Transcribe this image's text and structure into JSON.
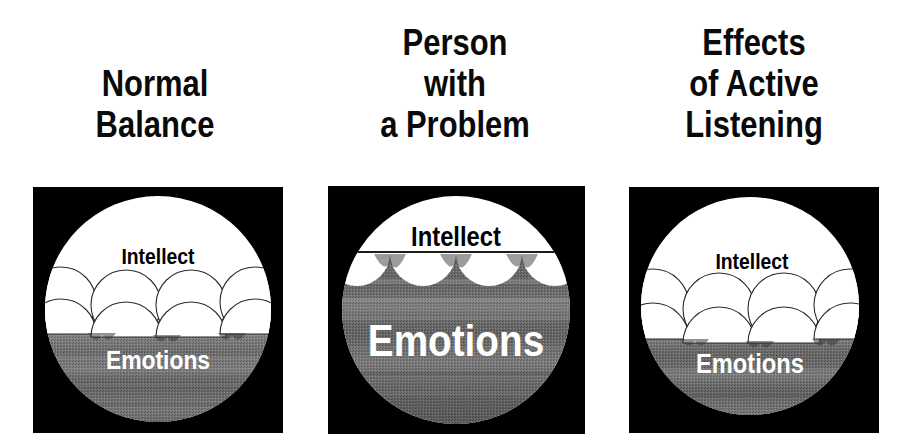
{
  "figure": {
    "background_color": "#ffffff",
    "panel_background_color": "#000000",
    "intellect_color": "#ffffff",
    "emotions_color": "#6e6e6e",
    "title_color": "#0a0a0a"
  },
  "panels": [
    {
      "id": "normal-balance",
      "title_lines": [
        "Normal",
        "Balance"
      ],
      "labels": {
        "intellect": "Intellect",
        "emotions": "Emotions"
      },
      "ball_count": 4,
      "waterline_description": "balls float high, roughly two thirds above the waterline",
      "water_level_fraction": 0.54,
      "intellect_label_color": "#000000",
      "emotions_label_color": "#ffffff"
    },
    {
      "id": "person-with-a-problem",
      "title_lines": [
        "Person",
        "with",
        "a Problem"
      ],
      "labels": {
        "intellect": "Intellect",
        "emotions": "Emotions"
      },
      "ball_count": 4,
      "waterline_description": "water is high, balls are nearly submerged leaving only scalloped tops showing",
      "water_level_fraction": 0.22,
      "intellect_label_color": "#000000",
      "emotions_label_color": "#ffffff"
    },
    {
      "id": "effects-of-active-listening",
      "title_lines": [
        "Effects",
        "of Active",
        "Listening"
      ],
      "labels": {
        "intellect": "Intellect",
        "emotions": "Emotions"
      },
      "ball_count": 4,
      "waterline_description": "water level drops again, balls ride high like normal balance",
      "water_level_fraction": 0.58,
      "intellect_label_color": "#000000",
      "emotions_label_color": "#ffffff"
    }
  ]
}
